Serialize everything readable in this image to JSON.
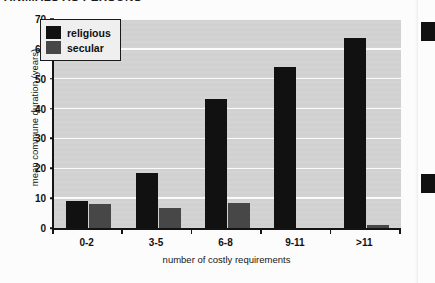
{
  "page": {
    "running_header": "ANIMALS AS PERSONS",
    "background_color": "#fcfcfc",
    "edge_marks": 2
  },
  "chart_data": {
    "type": "bar",
    "title": "",
    "xlabel": "number of costly requirements",
    "ylabel": "mean commune duration (years)",
    "categories": [
      "0-2",
      "3-5",
      "6-8",
      "9-11",
      ">11"
    ],
    "series": [
      {
        "name": "religious",
        "color": "#111111",
        "values": [
          9,
          18.5,
          43.3,
          54,
          63.5
        ]
      },
      {
        "name": "secular",
        "color": "#474747",
        "values": [
          8,
          6.8,
          8.3,
          0,
          1
        ]
      }
    ],
    "ylim": [
      0,
      70
    ],
    "y_ticks": [
      0,
      10,
      20,
      30,
      40,
      50,
      60,
      70
    ],
    "y_tick_labels": [
      "0",
      "10",
      "20",
      "30",
      "40",
      "50",
      "60",
      "70"
    ],
    "grid": true,
    "grid_color": "#fbfbfb",
    "plot_background": "#d3d3d3",
    "legend_position": "top-left",
    "legend_entries": [
      "religious",
      "secular"
    ]
  }
}
